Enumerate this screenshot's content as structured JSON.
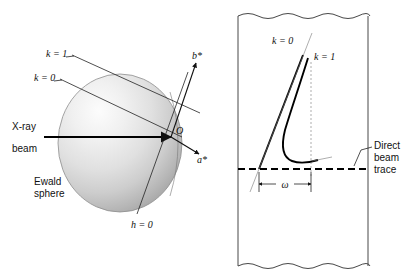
{
  "figure": {
    "background_color": "#ffffff",
    "ink_color": "#111111",
    "sphere_fill_light": "#f2f2f2",
    "sphere_fill_dark": "#9a9a9a"
  },
  "left_panel": {
    "name": "ewald-sphere-construction",
    "labels": {
      "k_one": "k = 1",
      "k_zero": "k = 0",
      "h_zero": "h = 0",
      "origin": "O",
      "b_star": "b*",
      "a_star": "a*",
      "xray_line1": "X-ray",
      "xray_line2": "beam",
      "ewald_line1": "Ewald",
      "ewald_line2": "sphere"
    }
  },
  "right_panel": {
    "name": "rotation-film-trace",
    "labels": {
      "k_zero": "k = 0",
      "k_one": "k = 1",
      "omega": "ω",
      "direct_line1": "Direct",
      "direct_line2": "beam",
      "direct_line3": "trace"
    }
  }
}
